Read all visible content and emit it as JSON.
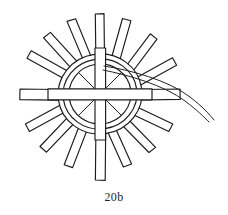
{
  "figure": {
    "caption": "20b",
    "title": "20b",
    "kind": "line-drawing",
    "background_color": "#ffffff",
    "ink_color": "#1b1b1b",
    "canvas": {
      "width": 228,
      "height": 215
    },
    "center": {
      "x": 100,
      "y": 94
    },
    "hub": {
      "name": "central-hub",
      "rings": [
        {
          "label": "outer-ring",
          "rx": 42,
          "ry": 40,
          "rotation": -8
        },
        {
          "label": "middle-ring",
          "rx": 37,
          "ry": 35,
          "rotation": -8
        },
        {
          "label": "inner-ring",
          "rx": 31,
          "ry": 30,
          "rotation": -8
        }
      ],
      "cross": {
        "label": "hub-cross",
        "vertical_bar_width": 11,
        "horizontal_bar_height": 11,
        "vertical_extent": 46,
        "horizontal_extent": 52
      }
    },
    "spokes": {
      "name": "spoke-set",
      "count": 16,
      "shape": "tapered-rod",
      "inner_radius": 26,
      "items": [
        {
          "index": 0,
          "angle_deg": -90,
          "length": 86,
          "width": 9,
          "emphasis": "long"
        },
        {
          "index": 1,
          "angle_deg": -67,
          "length": 78,
          "width": 9,
          "emphasis": "normal"
        },
        {
          "index": 2,
          "angle_deg": -45,
          "length": 72,
          "width": 9,
          "emphasis": "normal"
        },
        {
          "index": 3,
          "angle_deg": -22,
          "length": 70,
          "width": 9,
          "emphasis": "normal"
        },
        {
          "index": 4,
          "angle_deg": 0,
          "length": 80,
          "width": 10,
          "emphasis": "long"
        },
        {
          "index": 5,
          "angle_deg": 22,
          "length": 72,
          "width": 9,
          "emphasis": "normal"
        },
        {
          "index": 6,
          "angle_deg": 45,
          "length": 74,
          "width": 9,
          "emphasis": "normal"
        },
        {
          "index": 7,
          "angle_deg": 67,
          "length": 76,
          "width": 9,
          "emphasis": "normal"
        },
        {
          "index": 8,
          "angle_deg": 90,
          "length": 88,
          "width": 10,
          "emphasis": "long"
        },
        {
          "index": 9,
          "angle_deg": 112,
          "length": 76,
          "width": 9,
          "emphasis": "normal"
        },
        {
          "index": 10,
          "angle_deg": 135,
          "length": 72,
          "width": 9,
          "emphasis": "normal"
        },
        {
          "index": 11,
          "angle_deg": 157,
          "length": 70,
          "width": 9,
          "emphasis": "normal"
        },
        {
          "index": 12,
          "angle_deg": 180,
          "length": 84,
          "width": 10,
          "emphasis": "long"
        },
        {
          "index": 13,
          "angle_deg": 202,
          "length": 70,
          "width": 9,
          "emphasis": "normal"
        },
        {
          "index": 14,
          "angle_deg": 225,
          "length": 72,
          "width": 9,
          "emphasis": "normal"
        },
        {
          "index": 15,
          "angle_deg": 247,
          "length": 76,
          "width": 9,
          "emphasis": "normal"
        }
      ]
    },
    "tail": {
      "name": "curved-tail",
      "description": "thin double-line tendril leaving the hub at upper right and curving down to the right edge",
      "stroke_count": 2,
      "start": {
        "x": 118,
        "y": 72
      },
      "end": {
        "x": 214,
        "y": 119
      }
    }
  }
}
